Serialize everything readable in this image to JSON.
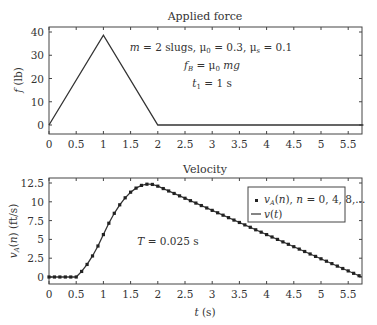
{
  "chart_data": [
    {
      "type": "line",
      "title": "Applied force",
      "xlabel": "",
      "ylabel": "f (lb)",
      "xlim": [
        0,
        5.8
      ],
      "ylim": [
        -3,
        42
      ],
      "xticks": [
        0,
        0.5,
        1,
        1.5,
        2,
        2.5,
        3,
        3.5,
        4,
        4.5,
        5,
        5.5
      ],
      "xtick_labels": [
        "0",
        "0.5",
        "1",
        "1.5",
        "2",
        "2.5",
        "3",
        "3.5",
        "4",
        "4.5",
        "5",
        "5.5"
      ],
      "yticks": [
        0,
        10,
        20,
        30,
        40
      ],
      "ytick_labels": [
        "0",
        "10",
        "20",
        "30",
        "40"
      ],
      "grid": false,
      "series": [
        {
          "name": "f(t)",
          "x": [
            0,
            1,
            2,
            5.8
          ],
          "y": [
            0,
            38.64,
            0,
            0
          ]
        }
      ],
      "annotations": [
        "m = 2 slugs, μ0 = 0.3, μs = 0.1",
        "fB = μ0 mg",
        "t1 = 1 s"
      ]
    },
    {
      "type": "line",
      "title": "Velocity",
      "xlabel": "t (s)",
      "ylabel": "vA(n) (ft/s)",
      "xlim": [
        0,
        5.8
      ],
      "ylim": [
        -1,
        13
      ],
      "xticks": [
        0,
        0.5,
        1,
        1.5,
        2,
        2.5,
        3,
        3.5,
        4,
        4.5,
        5,
        5.5
      ],
      "xtick_labels": [
        "0",
        "0.5",
        "1",
        "1.5",
        "2",
        "2.5",
        "3",
        "3.5",
        "4",
        "4.5",
        "5",
        "5.5"
      ],
      "yticks": [
        0,
        2.5,
        5,
        7.5,
        10,
        12.5
      ],
      "ytick_labels": [
        "0",
        "2.5",
        "5",
        "7.5",
        "10",
        "12.5"
      ],
      "grid": false,
      "legend_position": "upper right",
      "series": [
        {
          "name": "vA(n), n = 0, 4, 8,...",
          "style": "markers",
          "x": [
            0,
            0.1,
            0.2,
            0.3,
            0.4,
            0.5,
            0.6,
            0.7,
            0.8,
            0.9,
            1.0,
            1.1,
            1.2,
            1.3,
            1.4,
            1.5,
            1.6,
            1.7,
            1.8,
            1.9,
            2.0,
            2.1,
            2.2,
            2.3,
            2.4,
            2.5,
            2.6,
            2.7,
            2.8,
            2.9,
            3.0,
            3.1,
            3.2,
            3.3,
            3.4,
            3.5,
            3.6,
            3.7,
            3.8,
            3.9,
            4.0,
            4.1,
            4.2,
            4.3,
            4.4,
            4.5,
            4.6,
            4.7,
            4.8,
            4.9,
            5.0,
            5.1,
            5.2,
            5.3,
            5.4,
            5.5,
            5.6,
            5.7
          ],
          "y": [
            0,
            0,
            0,
            0,
            0,
            0,
            0.74,
            1.67,
            2.8,
            4.12,
            5.64,
            7.15,
            8.47,
            9.6,
            10.53,
            11.28,
            11.82,
            12.18,
            12.34,
            12.31,
            12.08,
            11.76,
            11.44,
            11.11,
            10.79,
            10.47,
            10.15,
            9.83,
            9.5,
            9.18,
            8.86,
            8.54,
            8.22,
            7.89,
            7.57,
            7.25,
            6.93,
            6.61,
            6.28,
            5.96,
            5.64,
            5.32,
            5.0,
            4.67,
            4.35,
            4.03,
            3.71,
            3.39,
            3.06,
            2.74,
            2.42,
            2.1,
            1.78,
            1.45,
            1.13,
            0.81,
            0.49,
            0.17
          ]
        },
        {
          "name": "v(t)",
          "style": "line",
          "x": [
            0,
            0.5,
            0.6,
            0.7,
            0.8,
            0.9,
            1.0,
            1.1,
            1.2,
            1.3,
            1.4,
            1.5,
            1.6,
            1.7,
            1.8,
            1.833,
            1.9,
            2.0,
            5.75
          ],
          "y": [
            0,
            0,
            0.74,
            1.67,
            2.8,
            4.12,
            5.64,
            7.15,
            8.47,
            9.6,
            10.53,
            11.28,
            11.82,
            12.18,
            12.34,
            12.35,
            12.31,
            12.08,
            0
          ]
        }
      ],
      "annotations": [
        "T = 0.025 s"
      ]
    }
  ],
  "top": {
    "title": "Applied force",
    "ylabel": "f (lb)",
    "ann1": "m = 2 slugs, μ0 = 0.3, μs = 0.1",
    "ann2": "fB = μ0 mg",
    "ann3": "t1 = 1 s"
  },
  "bottom": {
    "title": "Velocity",
    "xlabel": "t (s)",
    "ylabel": "vA(n) (ft/s)",
    "ann": "T = 0.025 s",
    "legend1": "vA(n), n = 0, 4, 8,...",
    "legend2": "v(t)"
  }
}
